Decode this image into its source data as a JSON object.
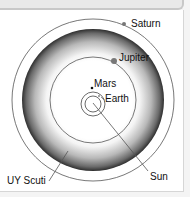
{
  "diagram": {
    "title": "",
    "bodies": [
      {
        "name": "Saturn",
        "label": "Saturn",
        "orbit_radius_px": 81
      },
      {
        "name": "Jupiter",
        "label": "Jupiter",
        "orbit_radius_px": 43
      },
      {
        "name": "Mars",
        "label": "Mars",
        "orbit_radius_px": 12
      },
      {
        "name": "Earth",
        "label": "Earth",
        "orbit_radius_px": 8
      }
    ],
    "stars": [
      {
        "name": "UY Scuti",
        "label": "UY Scuti",
        "radius_px": 71
      },
      {
        "name": "Sun",
        "label": "Sun"
      }
    ],
    "labels": {
      "saturn": "Saturn",
      "jupiter": "Jupiter",
      "mars": "Mars",
      "earth": "Earth",
      "uy_scuti": "UY Scuti",
      "sun": "Sun"
    },
    "colors": {
      "background": "#ffffff",
      "ring_dark": "#3a3a3a",
      "ring_light": "#f0f0f0",
      "orbit_line": "#555555"
    }
  }
}
